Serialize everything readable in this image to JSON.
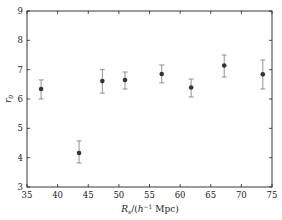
{
  "chart_data": {
    "type": "scatter",
    "title": "",
    "xlabel": "R_s/(h^-1 Mpc)",
    "xlabel_parts": {
      "main": "R",
      "sub": "s",
      "rest": "/(h",
      "sup": "−1",
      "tail": " Mpc)"
    },
    "ylabel": "r_0",
    "ylabel_parts": {
      "main": "r",
      "sub": "0"
    },
    "xlim": [
      35,
      75
    ],
    "ylim": [
      3,
      9
    ],
    "xticks": [
      35,
      40,
      45,
      50,
      55,
      60,
      65,
      70,
      75
    ],
    "yticks": [
      3,
      4,
      5,
      6,
      7,
      8,
      9
    ],
    "grid": false,
    "legend": null,
    "series": [
      {
        "name": "r0",
        "marker": "circle",
        "color": "#333333",
        "points": [
          {
            "x": 37.3,
            "y": 6.34,
            "err_low": 6.0,
            "err_high": 6.65
          },
          {
            "x": 43.5,
            "y": 4.16,
            "err_low": 3.82,
            "err_high": 4.57
          },
          {
            "x": 47.3,
            "y": 6.61,
            "err_low": 6.2,
            "err_high": 7.0
          },
          {
            "x": 51.0,
            "y": 6.65,
            "err_low": 6.34,
            "err_high": 6.92
          },
          {
            "x": 57.0,
            "y": 6.85,
            "err_low": 6.55,
            "err_high": 7.16
          },
          {
            "x": 61.8,
            "y": 6.39,
            "err_low": 6.07,
            "err_high": 6.68
          },
          {
            "x": 67.2,
            "y": 7.14,
            "err_low": 6.75,
            "err_high": 7.5
          },
          {
            "x": 73.5,
            "y": 6.84,
            "err_low": 6.34,
            "err_high": 7.33
          }
        ]
      }
    ]
  }
}
